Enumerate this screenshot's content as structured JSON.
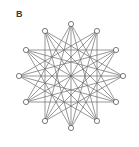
{
  "figure": {
    "panel_label": "B",
    "caption": "",
    "background_color": "#ffffff",
    "edge_color": "#6b6b6b",
    "vertex_stroke_color": "#5a5a5a",
    "vertex_fill_color": "#ffffff",
    "label_color": "#3b3b3b"
  },
  "graph": {
    "name": "circulant-graph",
    "vertex_count": 12,
    "layout": "circular",
    "center": {
      "x": 71,
      "y": 76
    },
    "radius": 52,
    "start_angle_deg": -90,
    "angle_step_deg": 30,
    "vertex_radius": 2.6,
    "edge_width": 0.7,
    "chord_steps": [
      4,
      5,
      6
    ],
    "vertices": [
      {
        "id": 0,
        "x": 71,
        "y": 24,
        "angle_deg": -90
      },
      {
        "id": 1,
        "x": 97,
        "y": 31,
        "angle_deg": -60
      },
      {
        "id": 2,
        "x": 116,
        "y": 50,
        "angle_deg": -30
      },
      {
        "id": 3,
        "x": 123,
        "y": 76,
        "angle_deg": 0
      },
      {
        "id": 4,
        "x": 116,
        "y": 102,
        "angle_deg": 30
      },
      {
        "id": 5,
        "x": 97,
        "y": 121,
        "angle_deg": 60
      },
      {
        "id": 6,
        "x": 71,
        "y": 128,
        "angle_deg": 90
      },
      {
        "id": 7,
        "x": 45,
        "y": 121,
        "angle_deg": 120
      },
      {
        "id": 8,
        "x": 26,
        "y": 102,
        "angle_deg": 150
      },
      {
        "id": 9,
        "x": 19,
        "y": 76,
        "angle_deg": 180
      },
      {
        "id": 10,
        "x": 26,
        "y": 50,
        "angle_deg": 210
      },
      {
        "id": 11,
        "x": 45,
        "y": 31,
        "angle_deg": 240
      }
    ],
    "edges": [
      [
        0,
        4
      ],
      [
        1,
        5
      ],
      [
        2,
        6
      ],
      [
        3,
        7
      ],
      [
        4,
        8
      ],
      [
        5,
        9
      ],
      [
        6,
        10
      ],
      [
        7,
        11
      ],
      [
        8,
        0
      ],
      [
        9,
        1
      ],
      [
        10,
        2
      ],
      [
        11,
        3
      ],
      [
        0,
        5
      ],
      [
        1,
        6
      ],
      [
        2,
        7
      ],
      [
        3,
        8
      ],
      [
        4,
        9
      ],
      [
        5,
        10
      ],
      [
        6,
        11
      ],
      [
        7,
        0
      ],
      [
        8,
        1
      ],
      [
        9,
        2
      ],
      [
        10,
        3
      ],
      [
        11,
        4
      ],
      [
        0,
        6
      ],
      [
        1,
        7
      ],
      [
        2,
        8
      ],
      [
        3,
        9
      ],
      [
        4,
        10
      ],
      [
        5,
        11
      ]
    ]
  }
}
